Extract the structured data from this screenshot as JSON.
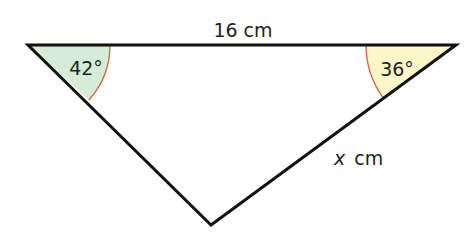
{
  "diagram": {
    "type": "triangle",
    "vertices": {
      "left": [
        28,
        45
      ],
      "right": [
        456,
        45
      ],
      "bottom": [
        211,
        225
      ]
    },
    "top_side_label": "16 cm",
    "right_side_label_var": "x",
    "right_side_label_unit": "cm",
    "left_angle_label": "42°",
    "right_angle_label": "36°",
    "colors": {
      "edge": "#111111",
      "arc": "#d9603a",
      "left_angle_fill": "#d6ecd6",
      "right_angle_fill": "#fbf7c8"
    }
  }
}
